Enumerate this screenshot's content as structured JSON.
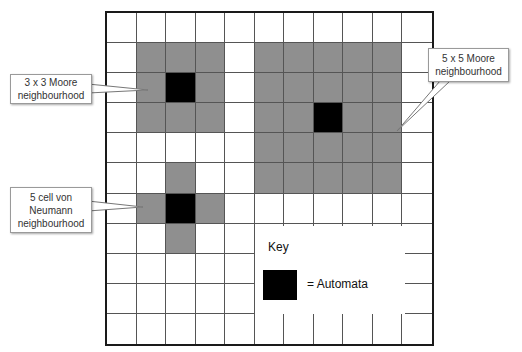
{
  "caption": {
    "visible_text": ""
  },
  "grid": {
    "rows": 11,
    "cols": 11,
    "colors": {
      "empty": "#ffffff",
      "neighbour": "#8f8f8f",
      "automaton": "#000000",
      "line": "#555555"
    },
    "cells": [
      "00000000000",
      "0GGG0GGGGG0",
      "0GBG0GGGGG0",
      "0GGG0GGBGG0",
      "00000GGGGG0",
      "00G00GGGGG0",
      "0GBG0000000",
      "00G00000000",
      "00000000000",
      "00000000000",
      "00000000000"
    ]
  },
  "callouts": {
    "moore3": {
      "lines": [
        "3 x 3 Moore",
        "neighbourhood"
      ]
    },
    "moore5": {
      "lines": [
        "5 x 5 Moore",
        "neighbourhood"
      ]
    },
    "vonneumann": {
      "lines": [
        "5 cell von",
        "Neumann",
        "neighbourhood"
      ]
    }
  },
  "key": {
    "title": "Key",
    "automata_label": "= Automata"
  }
}
